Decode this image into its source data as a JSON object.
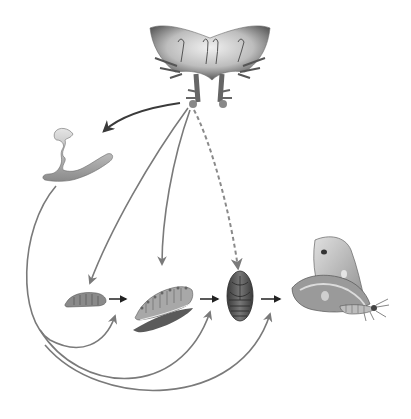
{
  "diagram": {
    "type": "insect-life-cycle-hormonal-control",
    "text_labels": [],
    "colors": {
      "background": "#ffffff",
      "arrow_dark": "#3a3a3a",
      "arrow_gray": "#7a7a7a",
      "tissue_light": "#d9d9d9",
      "tissue_mid": "#9a9a9a",
      "tissue_dark": "#555555"
    },
    "nodes": [
      {
        "id": "brain-endocrine",
        "icon": "brain-endocrine-glands-icon"
      },
      {
        "id": "prothoracic-gland",
        "icon": "prothoracic-gland-icon"
      },
      {
        "id": "young-larva",
        "icon": "young-larva-icon"
      },
      {
        "id": "mature-larva",
        "icon": "mature-larva-icon"
      },
      {
        "id": "pupa",
        "icon": "pupa-icon"
      },
      {
        "id": "adult-moth",
        "icon": "moth-icon"
      }
    ],
    "arrows": [
      {
        "from": "brain-endocrine",
        "to": "prothoracic-gland",
        "style": "solid-dark"
      },
      {
        "from": "brain-endocrine",
        "to": "young-larva",
        "style": "solid-gray"
      },
      {
        "from": "brain-endocrine",
        "to": "mature-larva",
        "style": "solid-gray"
      },
      {
        "from": "brain-endocrine",
        "to": "pupa",
        "style": "dashed-gray"
      },
      {
        "from": "young-larva",
        "to": "mature-larva",
        "style": "short-black"
      },
      {
        "from": "mature-larva",
        "to": "pupa",
        "style": "short-black"
      },
      {
        "from": "pupa",
        "to": "adult-moth",
        "style": "short-black"
      },
      {
        "from": "prothoracic-gland",
        "to": "young-larva",
        "style": "curved-gray"
      },
      {
        "from": "prothoracic-gland",
        "to": "mature-larva",
        "style": "curved-gray"
      },
      {
        "from": "prothoracic-gland",
        "to": "pupa",
        "style": "curved-gray"
      },
      {
        "from": "prothoracic-gland",
        "to": "adult-moth",
        "style": "curved-gray"
      }
    ]
  }
}
